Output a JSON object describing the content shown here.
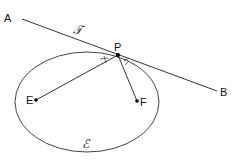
{
  "diagram": {
    "ellipse": {
      "label": "ℰ",
      "cx": 87,
      "cy": 102,
      "rx": 72,
      "ry": 50,
      "stroke": "#444444"
    },
    "tangent": {
      "label": "𝒯",
      "endpoints": [
        {
          "label": "A",
          "x": 22,
          "y": 19
        },
        {
          "label": "B",
          "x": 217,
          "y": 91
        }
      ]
    },
    "point_p": {
      "label": "P",
      "x": 118,
      "y": 55
    },
    "foci": [
      {
        "label": "E",
        "x": 36,
        "y": 100
      },
      {
        "label": "F",
        "x": 137,
        "y": 101
      }
    ],
    "angle_marks": [
      "equal-angle-tick-left",
      "equal-angle-tick-right"
    ],
    "line_color": "#333333"
  }
}
